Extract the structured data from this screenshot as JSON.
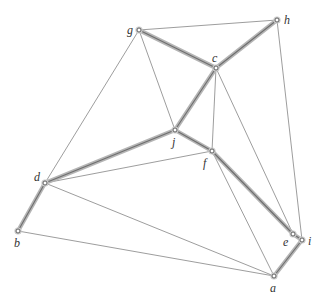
{
  "graph": {
    "nodes": [
      {
        "id": "g",
        "label": "g",
        "x": 139,
        "y": 30,
        "lx": 127,
        "ly": 34
      },
      {
        "id": "h",
        "label": "h",
        "x": 277,
        "y": 20,
        "lx": 284,
        "ly": 24
      },
      {
        "id": "c",
        "label": "c",
        "x": 216,
        "y": 68,
        "lx": 212,
        "ly": 62
      },
      {
        "id": "j",
        "label": "j",
        "x": 175,
        "y": 130,
        "lx": 172,
        "ly": 146
      },
      {
        "id": "f",
        "label": "f",
        "x": 212,
        "y": 151,
        "lx": 203,
        "ly": 167
      },
      {
        "id": "d",
        "label": "d",
        "x": 45,
        "y": 183,
        "lx": 34,
        "ly": 181
      },
      {
        "id": "b",
        "label": "b",
        "x": 18,
        "y": 231,
        "lx": 14,
        "ly": 247
      },
      {
        "id": "e",
        "label": "e",
        "x": 293,
        "y": 234,
        "lx": 283,
        "ly": 246
      },
      {
        "id": "i",
        "label": "i",
        "x": 302,
        "y": 240,
        "lx": 308,
        "ly": 245
      },
      {
        "id": "a",
        "label": "a",
        "x": 274,
        "y": 276,
        "lx": 270,
        "ly": 292
      }
    ],
    "thick_edges": [
      [
        "g",
        "c"
      ],
      [
        "c",
        "h"
      ],
      [
        "c",
        "j"
      ],
      [
        "j",
        "d"
      ],
      [
        "j",
        "f"
      ],
      [
        "f",
        "e"
      ],
      [
        "e",
        "i"
      ],
      [
        "i",
        "a"
      ],
      [
        "d",
        "b"
      ]
    ],
    "thin_edges": [
      [
        "g",
        "h"
      ],
      [
        "g",
        "d"
      ],
      [
        "g",
        "j"
      ],
      [
        "c",
        "f"
      ],
      [
        "c",
        "e"
      ],
      [
        "h",
        "i"
      ],
      [
        "d",
        "f"
      ],
      [
        "d",
        "a"
      ],
      [
        "b",
        "a"
      ],
      [
        "f",
        "a"
      ]
    ]
  }
}
